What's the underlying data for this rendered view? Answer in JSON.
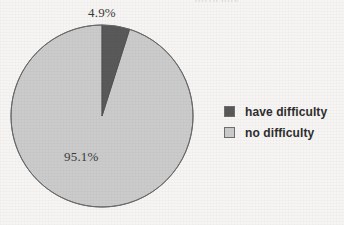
{
  "chart_data": {
    "type": "pie",
    "title": "",
    "subtitle": "",
    "xlabel": "",
    "ylabel": "",
    "grid": false,
    "legend_position": "right",
    "start_angle_deg": 0,
    "direction": "clockwise",
    "categories": [
      "have difficulty",
      "no difficulty"
    ],
    "values": [
      4.9,
      95.1
    ],
    "value_unit": "%",
    "slices": [
      {
        "label": "have difficulty",
        "value": 4.9,
        "data_label": "4.9%",
        "color": "#595959",
        "start_angle_deg": 0,
        "sweep_deg": 17.64
      },
      {
        "label": "no difficulty",
        "value": 95.1,
        "data_label": "95.1%",
        "color": "#cbcbcb",
        "start_angle_deg": 17.64,
        "sweep_deg": 342.36
      }
    ],
    "annotations": [
      "4.9%",
      "95.1%"
    ]
  },
  "pie": {
    "outline_color": "#6a6a6a",
    "have_difficulty_label": "4.9%",
    "no_difficulty_label": "95.1%"
  },
  "legend": {
    "items": [
      {
        "label": "have difficulty",
        "swatch_color": "#595959"
      },
      {
        "label": "no difficulty",
        "swatch_color": "#cbcbcb"
      }
    ]
  },
  "page": {
    "background_color": "#f6f5f3",
    "caption_remnant": "difficulty"
  },
  "colors": {
    "dark_slice": "#595959",
    "light_slice": "#cbcbcb",
    "outline": "#6a6a6a",
    "text": "#2e2e2e",
    "background": "#f6f5f3"
  }
}
